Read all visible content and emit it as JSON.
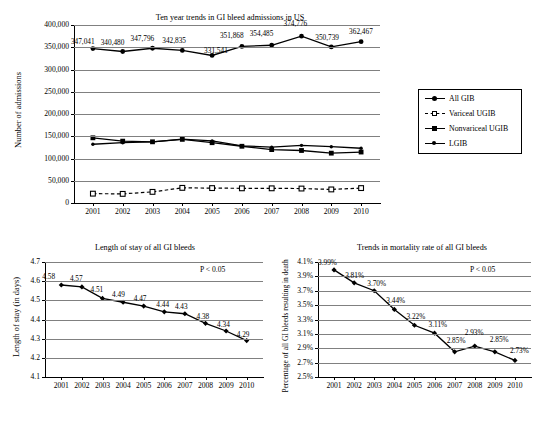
{
  "figure": {
    "panels": [
      "top",
      "bottom-left",
      "bottom-right"
    ]
  },
  "chart_data": [
    {
      "id": "admissions",
      "type": "line",
      "title": "Ten year trends in GI bleed admissions in US",
      "xlabel": "",
      "ylabel": "Number of admissions",
      "categories": [
        "2001",
        "2002",
        "2003",
        "2004",
        "2005",
        "2006",
        "2007",
        "2008",
        "2009",
        "2010"
      ],
      "ylim": [
        0,
        400000
      ],
      "yticks": [
        "0",
        "50,000",
        "100,000",
        "150,000",
        "200,000",
        "250,000",
        "300,000",
        "350,000",
        "400,000"
      ],
      "ytick_values": [
        0,
        50000,
        100000,
        150000,
        200000,
        250000,
        300000,
        350000,
        400000
      ],
      "grid": true,
      "legend_position": "right",
      "series": [
        {
          "name": "All GIB",
          "marker": "circle-filled",
          "line": "solid",
          "values": [
            347041,
            340480,
            347796,
            342835,
            331541,
            351868,
            354485,
            374776,
            350739,
            362467
          ],
          "data_labels": [
            "347,041",
            "340,480",
            "347,796",
            "342,835",
            "331,541",
            "351,868",
            "354,485",
            "374,776",
            "350,739",
            "362,467"
          ]
        },
        {
          "name": "Variceal UGIB",
          "marker": "square-open",
          "line": "dashed",
          "values": [
            21000,
            20500,
            25000,
            34000,
            33500,
            33000,
            33000,
            32500,
            30500,
            33500
          ],
          "data_labels": []
        },
        {
          "name": "Nonvariceal UGIB",
          "marker": "square-filled",
          "line": "solid",
          "values": [
            146500,
            139000,
            137500,
            143000,
            135500,
            127500,
            120000,
            118000,
            112000,
            114500
          ],
          "data_labels": []
        },
        {
          "name": "LGIB",
          "marker": "circle-small",
          "line": "solid",
          "values": [
            132000,
            135500,
            137500,
            143500,
            139500,
            128500,
            125500,
            129500,
            126500,
            123000
          ],
          "data_labels": []
        }
      ]
    },
    {
      "id": "length-of-stay",
      "type": "line",
      "title": "Length of stay of all GI bleeds",
      "xlabel": "",
      "ylabel": "Length of stay (in days)",
      "annotation": "P < 0.05",
      "categories": [
        "2001",
        "2002",
        "2003",
        "2004",
        "2005",
        "2006",
        "2007",
        "2008",
        "2009",
        "2010"
      ],
      "ylim": [
        4.1,
        4.7
      ],
      "yticks": [
        "4.1",
        "4.2",
        "4.3",
        "4.4",
        "4.5",
        "4.6",
        "4.7"
      ],
      "ytick_values": [
        4.1,
        4.2,
        4.3,
        4.4,
        4.5,
        4.6,
        4.7
      ],
      "grid": true,
      "series": [
        {
          "name": "Length of stay",
          "marker": "diamond-filled",
          "line": "solid",
          "values": [
            4.58,
            4.57,
            4.51,
            4.49,
            4.47,
            4.44,
            4.43,
            4.38,
            4.34,
            4.29
          ],
          "data_labels": [
            "4.58",
            "4.57",
            "4.51",
            "4.49",
            "4.47",
            "4.44",
            "4.43",
            "4.38",
            "4.34",
            "4.29"
          ]
        }
      ]
    },
    {
      "id": "mortality",
      "type": "line",
      "title": "Trends in mortality rate of all GI bleeds",
      "xlabel": "",
      "ylabel": "Percentage of all GI bleeds resulting in death",
      "annotation": "P < 0.05",
      "categories": [
        "2001",
        "2002",
        "2003",
        "2004",
        "2005",
        "2006",
        "2007",
        "2008",
        "2009",
        "2010"
      ],
      "ylim": [
        2.5,
        4.1
      ],
      "yticks": [
        "2.5%",
        "2.7%",
        "2.9%",
        "3.1%",
        "3.3%",
        "3.5%",
        "3.7%",
        "3.9%",
        "4.1%"
      ],
      "ytick_values": [
        2.5,
        2.7,
        2.9,
        3.1,
        3.3,
        3.5,
        3.7,
        3.9,
        4.1
      ],
      "grid": true,
      "series": [
        {
          "name": "Mortality rate",
          "marker": "diamond-filled",
          "line": "solid",
          "values": [
            3.99,
            3.81,
            3.7,
            3.44,
            3.22,
            3.11,
            2.85,
            2.93,
            2.85,
            2.73
          ],
          "data_labels": [
            "3.99%",
            "3.81%",
            "3.70%",
            "3.44%",
            "3.22%",
            "3.11%",
            "2.85%",
            "2.93%",
            "2.85%",
            "2.73%"
          ]
        }
      ]
    }
  ],
  "legend": {
    "items": [
      {
        "label": "All GIB",
        "marker": "circle-filled",
        "line": "solid"
      },
      {
        "label": "Variceal UGIB",
        "marker": "square-open",
        "line": "dashed"
      },
      {
        "label": "Nonvariceal UGIB",
        "marker": "square-filled",
        "line": "solid"
      },
      {
        "label": "LGIB",
        "marker": "circle-small",
        "line": "solid"
      }
    ]
  }
}
